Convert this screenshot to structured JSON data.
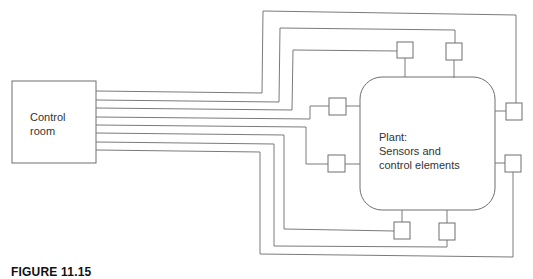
{
  "diagram": {
    "control_room": {
      "label_line1": "Control",
      "label_line2": "room"
    },
    "plant": {
      "label_line1": "Plant:",
      "label_line2": "Sensors and",
      "label_line3": "control elements"
    },
    "connections_count": 8,
    "sensor_boxes": [
      "top-left",
      "top-right",
      "left-upper",
      "left-lower",
      "right-upper",
      "right-lower",
      "bottom-left",
      "bottom-right"
    ],
    "colors": {
      "line": "#7a7a7a",
      "box": "#6e6e6e",
      "text": "#333333"
    }
  },
  "caption": {
    "text": "FIGURE 11.15"
  }
}
